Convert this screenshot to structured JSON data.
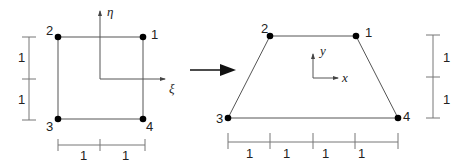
{
  "left_element": {
    "name": "parent square element",
    "nodes": [
      {
        "id": "1",
        "label": "1"
      },
      {
        "id": "2",
        "label": "2"
      },
      {
        "id": "3",
        "label": "3"
      },
      {
        "id": "4",
        "label": "4"
      }
    ],
    "axes": {
      "horizontal": "ξ",
      "vertical": "η"
    },
    "vertical_dims": [
      "1",
      "1"
    ],
    "horizontal_dims": [
      "1",
      "1"
    ]
  },
  "mapping_arrow": "maps to",
  "right_element": {
    "name": "trapezoidal physical element",
    "nodes": [
      {
        "id": "1",
        "label": "1"
      },
      {
        "id": "2",
        "label": "2"
      },
      {
        "id": "3",
        "label": "3"
      },
      {
        "id": "4",
        "label": "4"
      }
    ],
    "axes": {
      "horizontal": "x",
      "vertical": "y"
    },
    "vertical_dims": [
      "1",
      "1"
    ],
    "horizontal_dims": [
      "1",
      "1",
      "1",
      "1"
    ]
  }
}
